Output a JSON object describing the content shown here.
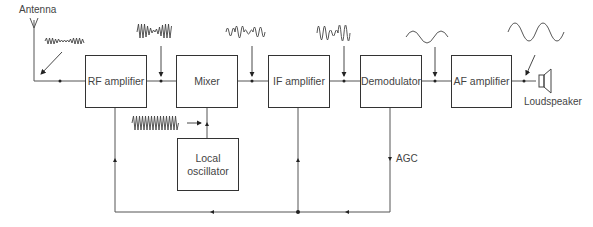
{
  "diagram": {
    "blocks": [
      {
        "id": "rf",
        "label": "RF amplifier"
      },
      {
        "id": "mixer",
        "label": "Mixer"
      },
      {
        "id": "if",
        "label": "IF amplifier"
      },
      {
        "id": "demod",
        "label": "Demodulator"
      },
      {
        "id": "af",
        "label": "AF amplifier"
      },
      {
        "id": "lo",
        "label": "Local oscillator"
      }
    ],
    "labels": {
      "antenna": "Antenna",
      "loudspeaker": "Loudspeaker",
      "agc": "AGC"
    },
    "connections": [
      {
        "from": "antenna",
        "to": "rf"
      },
      {
        "from": "rf",
        "to": "mixer"
      },
      {
        "from": "lo",
        "to": "mixer"
      },
      {
        "from": "mixer",
        "to": "if"
      },
      {
        "from": "if",
        "to": "demod"
      },
      {
        "from": "demod",
        "to": "af"
      },
      {
        "from": "af",
        "to": "loudspeaker"
      },
      {
        "from": "demod",
        "to": "rf",
        "label": "AGC"
      },
      {
        "from": "demod",
        "to": "if",
        "label": "AGC"
      }
    ],
    "waveforms": [
      {
        "at": "antenna-input",
        "type": "modulated RF"
      },
      {
        "at": "rf-output",
        "type": "amplified modulated RF"
      },
      {
        "at": "local-oscillator",
        "type": "high-frequency carrier"
      },
      {
        "at": "mixer-output",
        "type": "modulated IF"
      },
      {
        "at": "if-output",
        "type": "amplified modulated IF"
      },
      {
        "at": "demod-output",
        "type": "audio sine"
      },
      {
        "at": "af-output",
        "type": "amplified audio sine"
      }
    ]
  }
}
